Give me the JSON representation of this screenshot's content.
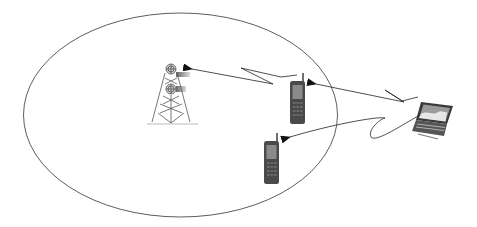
{
  "diagram": {
    "title": "",
    "coverage_area": {
      "shape": "ellipse",
      "stroke": "#333333"
    },
    "nodes": [
      {
        "id": "base-station",
        "type": "cell-tower",
        "label": ""
      },
      {
        "id": "phone-1",
        "type": "mobile-phone",
        "label": ""
      },
      {
        "id": "phone-2",
        "type": "mobile-phone",
        "label": ""
      },
      {
        "id": "laptop",
        "type": "laptop",
        "label": ""
      }
    ],
    "links": [
      {
        "from": "phone-1",
        "to": "base-station",
        "style": "wireless-zigzag-arrow"
      },
      {
        "from": "laptop",
        "to": "phone-1",
        "style": "wireless-zigzag-arrow"
      },
      {
        "from": "laptop",
        "to": "phone-2",
        "style": "wireless-zigzag-arrow"
      }
    ],
    "colors": {
      "line": "#222222",
      "device_body": "#4a4a4a",
      "device_screen": "#8a8a8a",
      "tower": "#555555"
    }
  }
}
